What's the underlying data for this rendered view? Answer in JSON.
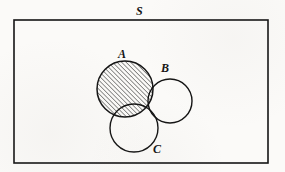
{
  "figure": {
    "kind": "venn-diagram",
    "background_color": "#fbfaf8",
    "ink_color": "#141414",
    "shading": {
      "style": "diagonal-hatch",
      "angle_degrees": 45,
      "line_color": "#141414",
      "line_spacing_px": 3.2,
      "line_width_px": 0.9,
      "shaded_regions": [
        "A",
        "B-intersect-C"
      ]
    },
    "universe": {
      "label": "S",
      "shape": "rectangle",
      "x": 14,
      "y": 20,
      "width": 254,
      "height": 143,
      "stroke_width": 1.6
    },
    "sets": [
      {
        "name": "A",
        "label": "A",
        "cx": 125,
        "cy": 89,
        "r": 28,
        "shaded": true,
        "stroke_width": 1.5
      },
      {
        "name": "B",
        "label": "B",
        "cx": 170,
        "cy": 101,
        "r": 22,
        "shaded": false,
        "stroke_width": 1.4
      },
      {
        "name": "C",
        "label": "C",
        "cx": 134,
        "cy": 128,
        "r": 24,
        "shaded": false,
        "stroke_width": 1.4
      }
    ],
    "labels": [
      {
        "name": "S",
        "text": "S",
        "x": 136,
        "y": 5,
        "style": "italic-serif-bold"
      },
      {
        "name": "A",
        "text": "A",
        "x": 118,
        "y": 48,
        "style": "italic-serif-bold"
      },
      {
        "name": "B",
        "text": "B",
        "x": 161,
        "y": 62,
        "style": "italic-serif-bold"
      },
      {
        "name": "C",
        "text": "C",
        "x": 153,
        "y": 143,
        "style": "italic-serif-bold"
      }
    ]
  }
}
